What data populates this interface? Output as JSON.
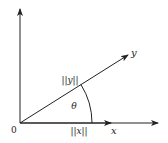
{
  "diagram": {
    "title": "",
    "origin_label": "0",
    "x_vector_label": "x",
    "y_vector_label": "y",
    "x_norm_label": "||x||",
    "y_norm_label": "||y||",
    "angle_label": "θ",
    "colors": {
      "stroke": "#222222",
      "background": "#ffffff"
    }
  }
}
